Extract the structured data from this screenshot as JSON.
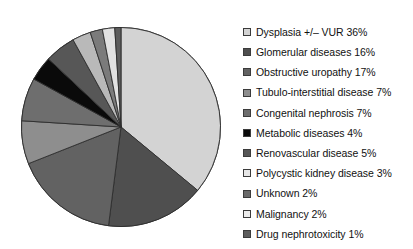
{
  "chart_data": {
    "type": "pie",
    "title": "",
    "subtitle": "",
    "xlabel": "",
    "ylabel": "",
    "legend_position": "right",
    "grid": false,
    "start_angle_deg": 0,
    "direction": "clockwise",
    "units": "percent",
    "total": 100,
    "categories": [
      "Dysplasia +/– VUR",
      "Glomerular diseases",
      "Obstructive uropathy",
      "Tubulo-interstitial disease",
      "Congenital nephrosis",
      "Metabolic diseases",
      "Renovascular disease",
      "Polycystic kidney disease",
      "Unknown",
      "Malignancy",
      "Drug nephrotoxicity"
    ],
    "values": [
      36,
      16,
      17,
      7,
      7,
      4,
      5,
      3,
      2,
      2,
      1
    ],
    "value_labels": [
      "36%",
      "16%",
      "17%",
      "7%",
      "7%",
      "4%",
      "5%",
      "3%",
      "2%",
      "2%",
      "1%"
    ],
    "colors": [
      "#d3d3d3",
      "#4f4f4f",
      "#626262",
      "#8e8e8e",
      "#6e6e6e",
      "#0a0a0a",
      "#575757",
      "#b9b9b9",
      "#7b7b7b",
      "#e2e2e2",
      "#5d5d5d"
    ],
    "slice_stroke": "#2e2e2e",
    "legend_entries": [
      {
        "label": "Dysplasia +/– VUR 36%",
        "swatch": "#d3d3d3"
      },
      {
        "label": "Glomerular diseases 16%",
        "swatch": "#4f4f4f"
      },
      {
        "label": "Obstructive uropathy 17%",
        "swatch": "#626262"
      },
      {
        "label": "Tubulo-interstitial disease 7%",
        "swatch": "#8e8e8e"
      },
      {
        "label": "Congenital nephrosis 7%",
        "swatch": "#6e6e6e"
      },
      {
        "label": "Metabolic diseases 4%",
        "swatch": "#0a0a0a"
      },
      {
        "label": "Renovascular disease 5%",
        "swatch": "#575757"
      },
      {
        "label": "Polycystic kidney disease 3%",
        "swatch": "#e6e6e6"
      },
      {
        "label": "Unknown 2%",
        "swatch": "#6a6a6a"
      },
      {
        "label": "Malignancy 2%",
        "swatch": "#ececec"
      },
      {
        "label": "Drug nephrotoxicity 1%",
        "swatch": "#5d5d5d"
      }
    ]
  }
}
